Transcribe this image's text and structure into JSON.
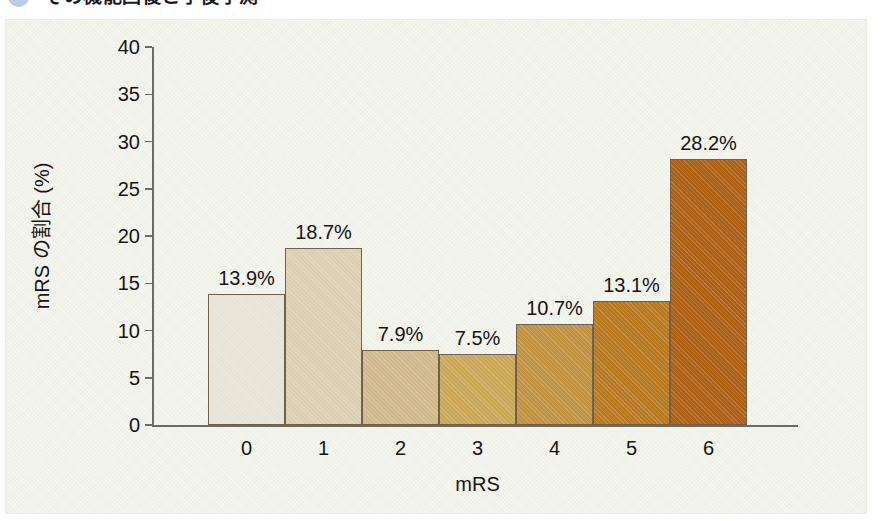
{
  "header": {
    "badge_icon": "blue-circle-badge",
    "title": "その機能回復と予後予測"
  },
  "chart_data": {
    "type": "bar",
    "title": "",
    "categories": [
      "0",
      "1",
      "2",
      "3",
      "4",
      "5",
      "6"
    ],
    "values": [
      13.9,
      18.7,
      7.9,
      7.5,
      10.7,
      13.1,
      28.2
    ],
    "value_labels": [
      "13.9%",
      "18.7%",
      "7.9%",
      "7.5%",
      "10.7%",
      "13.1%",
      "28.2%"
    ],
    "bar_colors": [
      "#e7e3d6",
      "#ddd0b2",
      "#cfb88a",
      "#c9a757",
      "#bf9140",
      "#b8781f",
      "#ad5f14"
    ],
    "xlabel": "mRS",
    "ylabel": "mRS の割合 (%)",
    "ylim": [
      0,
      40
    ],
    "ytick_labels": [
      "0",
      "5",
      "10",
      "15",
      "20",
      "25",
      "30",
      "35",
      "40"
    ],
    "ytick_values": [
      0,
      5,
      10,
      15,
      20,
      25,
      30,
      35,
      40
    ],
    "grid": false,
    "legend": "none",
    "unit": "%"
  },
  "colors": {
    "panel_background": "#f1f2ea",
    "page_background": "#ffffff",
    "axis": "#6b6b63",
    "text": "#151515",
    "bar_outline": "#6d6250",
    "badge": "#b9cde4"
  }
}
